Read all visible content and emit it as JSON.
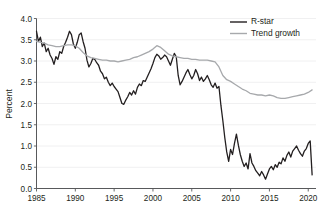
{
  "chart_data": {
    "type": "line",
    "title": "",
    "xlabel": "",
    "ylabel": "Percent",
    "xlim": [
      1985,
      2021
    ],
    "ylim": [
      0.0,
      4.0
    ],
    "grid": true,
    "legend_position": "top-right",
    "y_ticks": [
      "0.0",
      "0.5",
      "1.0",
      "1.5",
      "2.0",
      "2.5",
      "3.0",
      "3.5",
      "4.0"
    ],
    "y_tick_values": [
      0.0,
      0.5,
      1.0,
      1.5,
      2.0,
      2.5,
      3.0,
      3.5,
      4.0
    ],
    "x_ticks": [
      "1985",
      "1990",
      "1995",
      "2000",
      "2005",
      "2010",
      "2015",
      "2020"
    ],
    "x_tick_values": [
      1985,
      1990,
      1995,
      2000,
      2005,
      2010,
      2015,
      2020
    ],
    "series": [
      {
        "name": "R-star",
        "color": "#231f20",
        "width": 1.3,
        "x": [
          1985.0,
          1985.25,
          1985.5,
          1985.75,
          1986.0,
          1986.25,
          1986.5,
          1986.75,
          1987.0,
          1987.25,
          1987.5,
          1987.75,
          1988.0,
          1988.25,
          1988.5,
          1988.75,
          1989.0,
          1989.25,
          1989.5,
          1989.75,
          1990.0,
          1990.25,
          1990.5,
          1990.75,
          1991.0,
          1991.25,
          1991.5,
          1991.75,
          1992.0,
          1992.25,
          1992.5,
          1992.75,
          1993.0,
          1993.25,
          1993.5,
          1993.75,
          1994.0,
          1994.25,
          1994.5,
          1994.75,
          1995.0,
          1995.25,
          1995.5,
          1995.75,
          1996.0,
          1996.25,
          1996.5,
          1996.75,
          1997.0,
          1997.25,
          1997.5,
          1997.75,
          1998.0,
          1998.25,
          1998.5,
          1998.75,
          1999.0,
          1999.25,
          1999.5,
          1999.75,
          2000.0,
          2000.25,
          2000.5,
          2000.75,
          2001.0,
          2001.25,
          2001.5,
          2001.75,
          2002.0,
          2002.25,
          2002.5,
          2002.75,
          2003.0,
          2003.25,
          2003.5,
          2003.75,
          2004.0,
          2004.25,
          2004.5,
          2004.75,
          2005.0,
          2005.25,
          2005.5,
          2005.75,
          2006.0,
          2006.25,
          2006.5,
          2006.75,
          2007.0,
          2007.25,
          2007.5,
          2007.75,
          2008.0,
          2008.25,
          2008.5,
          2008.75,
          2009.0,
          2009.25,
          2009.5,
          2009.75,
          2010.0,
          2010.25,
          2010.5,
          2010.75,
          2011.0,
          2011.25,
          2011.5,
          2011.75,
          2012.0,
          2012.25,
          2012.5,
          2012.75,
          2013.0,
          2013.25,
          2013.5,
          2013.75,
          2014.0,
          2014.25,
          2014.5,
          2014.75,
          2015.0,
          2015.25,
          2015.5,
          2015.75,
          2016.0,
          2016.25,
          2016.5,
          2016.75,
          2017.0,
          2017.25,
          2017.5,
          2017.75,
          2018.0,
          2018.25,
          2018.5,
          2018.75,
          2019.0,
          2019.25,
          2019.5,
          2019.75,
          2020.0,
          2020.25,
          2020.5
        ],
        "values": [
          3.7,
          3.46,
          3.56,
          3.34,
          3.42,
          3.22,
          3.3,
          3.14,
          3.06,
          2.92,
          3.1,
          3.04,
          3.22,
          3.18,
          3.34,
          3.44,
          3.56,
          3.7,
          3.62,
          3.4,
          3.3,
          3.44,
          3.62,
          3.66,
          3.46,
          3.3,
          3.02,
          2.86,
          2.94,
          3.06,
          3.04,
          2.96,
          2.9,
          2.76,
          2.7,
          2.58,
          2.62,
          2.5,
          2.42,
          2.48,
          2.4,
          2.34,
          2.28,
          2.14,
          2.0,
          1.98,
          2.08,
          2.16,
          2.26,
          2.2,
          2.3,
          2.22,
          2.38,
          2.46,
          2.42,
          2.54,
          2.52,
          2.62,
          2.72,
          2.82,
          2.94,
          3.08,
          3.16,
          3.12,
          3.04,
          3.08,
          3.14,
          3.1,
          3.0,
          2.9,
          3.04,
          3.18,
          3.1,
          2.66,
          2.44,
          2.52,
          2.62,
          2.72,
          2.8,
          2.68,
          2.58,
          2.66,
          2.8,
          2.7,
          2.54,
          2.62,
          2.52,
          2.58,
          2.66,
          2.56,
          2.44,
          2.38,
          2.48,
          2.36,
          2.4,
          1.96,
          1.6,
          1.2,
          0.86,
          0.64,
          0.92,
          0.8,
          1.06,
          1.28,
          1.02,
          0.8,
          0.64,
          0.52,
          0.6,
          0.46,
          0.82,
          0.6,
          0.52,
          0.42,
          0.36,
          0.3,
          0.4,
          0.32,
          0.22,
          0.34,
          0.46,
          0.52,
          0.44,
          0.56,
          0.5,
          0.62,
          0.58,
          0.72,
          0.64,
          0.78,
          0.86,
          0.74,
          0.88,
          0.94,
          1.0,
          0.9,
          0.82,
          0.76,
          0.88,
          0.94,
          1.06,
          1.12,
          0.32
        ]
      },
      {
        "name": "Trend growth",
        "color": "#a7a9ac",
        "width": 1.3,
        "x": [
          1985.0,
          1985.5,
          1986.0,
          1986.5,
          1987.0,
          1987.5,
          1988.0,
          1988.5,
          1989.0,
          1989.5,
          1990.0,
          1990.5,
          1991.0,
          1991.5,
          1992.0,
          1992.5,
          1993.0,
          1993.5,
          1994.0,
          1994.5,
          1995.0,
          1995.5,
          1996.0,
          1996.5,
          1997.0,
          1997.5,
          1998.0,
          1998.5,
          1999.0,
          1999.5,
          2000.0,
          2000.5,
          2001.0,
          2001.5,
          2002.0,
          2002.5,
          2003.0,
          2003.5,
          2004.0,
          2004.5,
          2005.0,
          2005.5,
          2006.0,
          2006.5,
          2007.0,
          2007.5,
          2008.0,
          2008.5,
          2009.0,
          2009.5,
          2010.0,
          2010.5,
          2011.0,
          2011.5,
          2012.0,
          2012.5,
          2013.0,
          2013.5,
          2014.0,
          2014.5,
          2015.0,
          2015.5,
          2016.0,
          2016.5,
          2017.0,
          2017.5,
          2018.0,
          2018.5,
          2019.0,
          2019.5,
          2020.0,
          2020.5
        ],
        "values": [
          3.46,
          3.44,
          3.42,
          3.38,
          3.36,
          3.34,
          3.34,
          3.36,
          3.38,
          3.38,
          3.36,
          3.3,
          3.2,
          3.12,
          3.08,
          3.06,
          3.04,
          3.02,
          3.02,
          3.0,
          3.0,
          2.98,
          3.0,
          3.02,
          3.04,
          3.08,
          3.1,
          3.14,
          3.18,
          3.22,
          3.28,
          3.36,
          3.32,
          3.24,
          3.16,
          3.12,
          3.1,
          3.08,
          3.06,
          3.06,
          3.04,
          3.04,
          3.02,
          3.02,
          3.02,
          3.0,
          2.98,
          2.86,
          2.66,
          2.56,
          2.52,
          2.46,
          2.4,
          2.34,
          2.3,
          2.24,
          2.22,
          2.2,
          2.2,
          2.18,
          2.2,
          2.18,
          2.14,
          2.12,
          2.12,
          2.14,
          2.16,
          2.18,
          2.2,
          2.22,
          2.26,
          2.32
        ]
      }
    ],
    "legend": [
      {
        "label": "R-star",
        "color": "#231f20"
      },
      {
        "label": "Trend growth",
        "color": "#a7a9ac"
      }
    ]
  }
}
